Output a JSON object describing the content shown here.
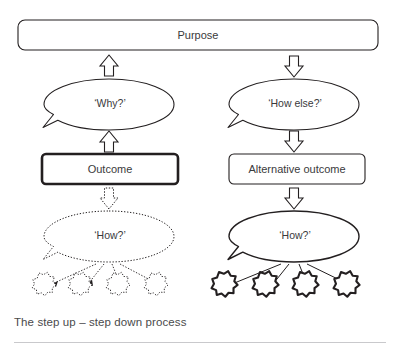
{
  "figure": {
    "caption": "The step up – step down process",
    "colors": {
      "stroke": "#231f20",
      "text": "#3a3a3c",
      "caption": "#4a4a4c",
      "rule": "#c9c9cc",
      "background": "#ffffff"
    }
  },
  "nodes": {
    "purpose": {
      "label": "Purpose"
    },
    "outcome": {
      "label": "Outcome"
    },
    "alternative_outcome": {
      "label": "Alternative outcome"
    }
  },
  "bubbles": {
    "why": {
      "label": "‘Why?’",
      "style": "solid",
      "side": "left"
    },
    "how_else": {
      "label": "‘How else?’",
      "style": "solid",
      "side": "right"
    },
    "how_left": {
      "label": "‘How?’",
      "style": "dotted",
      "side": "left"
    },
    "how_right": {
      "label": "‘How?’",
      "style": "solid",
      "side": "right"
    }
  },
  "arrows": {
    "why_to_purpose": {
      "direction": "up",
      "style": "solid"
    },
    "outcome_to_why": {
      "direction": "up",
      "style": "solid"
    },
    "outcome_to_how": {
      "direction": "down",
      "style": "dotted"
    },
    "purpose_to_how_else": {
      "direction": "down",
      "style": "solid"
    },
    "how_else_to_alternative": {
      "direction": "down",
      "style": "solid"
    },
    "alternative_to_how": {
      "direction": "down",
      "style": "solid"
    }
  },
  "bursts": {
    "left": {
      "count": 4,
      "style": "dotted",
      "connector": "dotted-arrow"
    },
    "right": {
      "count": 4,
      "style": "solid",
      "connector": "solid-line"
    }
  }
}
